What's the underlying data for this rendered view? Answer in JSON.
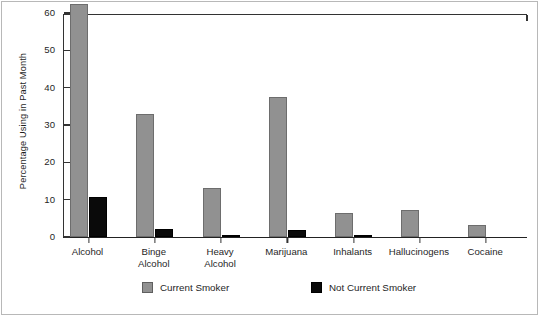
{
  "chart_data": {
    "type": "bar",
    "title": "",
    "xlabel": "",
    "ylabel": "Percentage Using in Past Month",
    "ylim": [
      0,
      60
    ],
    "yticks": [
      0,
      10,
      20,
      30,
      40,
      50,
      60
    ],
    "grid": false,
    "legend_position": "bottom",
    "categories": [
      "Alcohol",
      "Binge Alcohol",
      "Heavy Alcohol",
      "Marijuana",
      "Inhalants",
      "Hallucinogens",
      "Cocaine"
    ],
    "category_lines": [
      [
        "Alcohol"
      ],
      [
        "Binge",
        "Alcohol"
      ],
      [
        "Heavy",
        "Alcohol"
      ],
      [
        "Marijuana"
      ],
      [
        "Inhalants"
      ],
      [
        "Hallucinogens"
      ],
      [
        "Cocaine"
      ]
    ],
    "series": [
      {
        "name": "Current Smoker",
        "color": "#919191",
        "values": [
          62.5,
          33.0,
          13.0,
          37.5,
          6.3,
          7.3,
          3.2
        ]
      },
      {
        "name": "Not Current Smoker",
        "color": "#0a0a0a",
        "values": [
          10.7,
          2.2,
          0.5,
          2.0,
          0.5,
          0.0,
          0.0
        ]
      }
    ]
  },
  "legend": {
    "entries": [
      {
        "label": "Current Smoker",
        "swatch": "gray"
      },
      {
        "label": "Not Current Smoker",
        "swatch": "black"
      }
    ]
  },
  "axis": {
    "y_title": "Percentage Using in Past Month",
    "y_tick_labels": [
      "0",
      "10",
      "20",
      "30",
      "40",
      "50",
      "60"
    ]
  }
}
